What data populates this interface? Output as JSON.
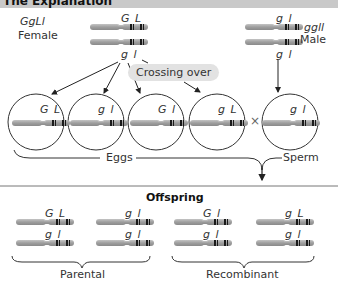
{
  "header": {
    "title": "The Explanation"
  },
  "parents": {
    "female": {
      "genotype": "GgLl",
      "sex": "Female",
      "top_alleles": "G L",
      "bottom_alleles": "g l"
    },
    "male": {
      "genotype": "ggll",
      "sex": "Male",
      "top_alleles": "g l",
      "bottom_alleles": "g l"
    }
  },
  "process": {
    "crossing_over_label": "Crossing over",
    "cross_symbol": "×"
  },
  "gametes": {
    "eggs": [
      {
        "alleles": "G L"
      },
      {
        "alleles": "g l"
      },
      {
        "alleles": "G l"
      },
      {
        "alleles": "g L"
      }
    ],
    "sperm": [
      {
        "alleles": "g l"
      }
    ],
    "eggs_label": "Eggs",
    "sperm_label": "Sperm"
  },
  "offspring": {
    "title": "Offspring",
    "groups": [
      {
        "label": "Parental",
        "individuals": [
          {
            "top": "G L",
            "bottom": "g l"
          },
          {
            "top": "g l",
            "bottom": "g l"
          }
        ]
      },
      {
        "label": "Recombinant",
        "individuals": [
          {
            "top": "G l",
            "bottom": "g l"
          },
          {
            "top": "g L",
            "bottom": "g l"
          }
        ]
      }
    ]
  },
  "colors": {
    "header_bg": "#c9c9c9",
    "chromosome": "#a8a8a8",
    "chromosome_band": "#1a1a1a",
    "bubble_bg": "#e2e2e2",
    "line": "#333333"
  }
}
